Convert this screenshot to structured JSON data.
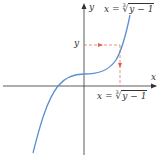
{
  "diagram": {
    "type": "function-graph",
    "axes": {
      "x_label": "x",
      "y_label": "y"
    },
    "labels": {
      "y_marker": "y",
      "top_formula": {
        "lhs": "x",
        "eq": "=",
        "index": "3",
        "radicand": "y − 1"
      },
      "bottom_formula": {
        "lhs": "x",
        "eq": "=",
        "index": "3",
        "radicand": "y − 1"
      }
    },
    "colors": {
      "axis": "#333333",
      "curve": "#5b8fd0",
      "dashed_guides": "#e0604a",
      "text": "#333333"
    }
  }
}
